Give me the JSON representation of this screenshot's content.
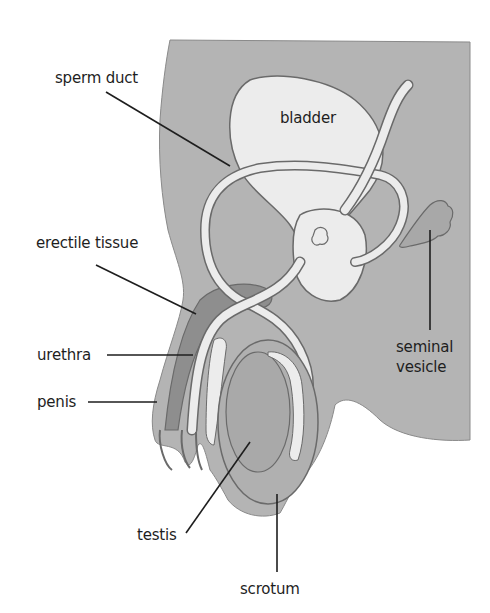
{
  "diagram": {
    "labels": {
      "sperm_duct": "sperm duct",
      "bladder": "bladder",
      "erectile_tissue": "erectile tissue",
      "urethra": "urethra",
      "penis": "penis",
      "seminal_vesicle_line1": "seminal",
      "seminal_vesicle_line2": "vesicle",
      "testis": "testis",
      "scrotum": "scrotum"
    },
    "colors": {
      "body_fill": "#b4b4b4",
      "organ_light": "#ececec",
      "erectile_fill": "#8e8e8e",
      "testis_fill": "#a9a9a9",
      "outline": "#6a6a6a",
      "leader_line": "#1e1e1e",
      "text": "#1e1e1e"
    }
  }
}
